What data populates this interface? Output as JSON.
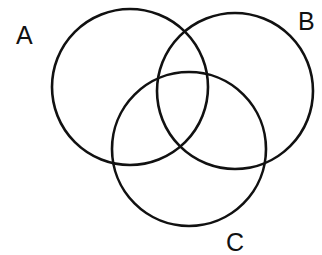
{
  "diagram": {
    "type": "venn",
    "set_count": 3,
    "stroke_color": "#111111",
    "background": "#ffffff",
    "sets": [
      {
        "id": "A",
        "label": "A",
        "cx": 130,
        "cy": 87,
        "r": 78
      },
      {
        "id": "B",
        "label": "B",
        "cx": 235,
        "cy": 91,
        "r": 78
      },
      {
        "id": "C",
        "label": "C",
        "cx": 189,
        "cy": 149,
        "r": 77
      }
    ]
  }
}
